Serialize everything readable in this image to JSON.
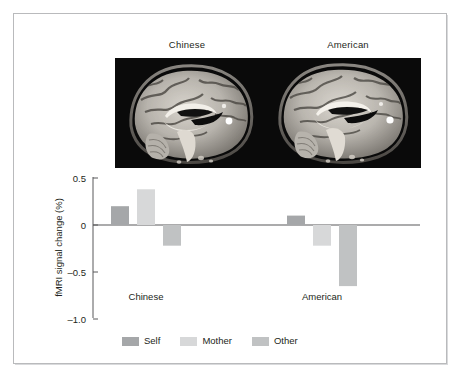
{
  "figure": {
    "brain_panel": {
      "left_title": "Chinese",
      "right_title": "American",
      "background_color": "#0a0a0a",
      "slice_description": "sagittal MRI brain slice"
    }
  },
  "chart_data": {
    "type": "bar",
    "title": "",
    "xlabel": "",
    "ylabel": "fMRI signal change (%)",
    "ylim": [
      -1.0,
      0.5
    ],
    "ytick_labels": [
      "0.5",
      "0",
      "–0.5",
      "–1.0"
    ],
    "ytick_values": [
      0.5,
      0,
      -0.5,
      -1.0
    ],
    "grid": false,
    "legend_position": "bottom",
    "categories": [
      "Chinese",
      "American"
    ],
    "series": [
      {
        "name": "Self",
        "color": "#a5a7a9",
        "values": [
          0.2,
          0.1
        ]
      },
      {
        "name": "Mother",
        "color": "#d7d8d9",
        "values": [
          0.38,
          -0.22
        ]
      },
      {
        "name": "Other",
        "color": "#c0c2c3",
        "values": [
          -0.22,
          -0.65
        ]
      }
    ]
  }
}
